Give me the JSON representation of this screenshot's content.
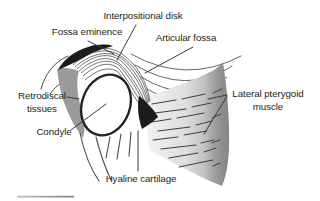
{
  "figure": {
    "labels": {
      "interpositional_disk": "Interpositional disk",
      "fossa_eminence": "Fossa eminence",
      "articular_fossa": "Articular fossa",
      "retrodiscal_line1": "Retrodiscal",
      "retrodiscal_line2": "tissues",
      "condyle": "Condyle",
      "pterygoid_line1": "Lateral pterygoid",
      "pterygoid_line2": "muscle",
      "hyaline_cartilage": "Hyaline cartilage"
    },
    "colors": {
      "background": "#ffffff",
      "label_text": "#231f20",
      "outline": "#3a3a3a",
      "dark_fill": "#1b1b1b",
      "retrodiscal_gray": "#9a9a9a",
      "muscle_gray_dark": "#858585",
      "muscle_gray_light": "#f0f0f0",
      "bottom_rule_gray": "#949494"
    }
  }
}
